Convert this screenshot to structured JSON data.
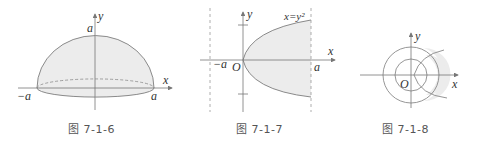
{
  "figures": [
    {
      "id": "7-1-6",
      "caption": "图 7-1-6",
      "description": "Upper half of an ellipsoid / hemisphere of radius a over the x-axis",
      "labels": {
        "y_axis": "y",
        "x_axis": "x",
        "top": "a",
        "left": "−a",
        "right": "a"
      }
    },
    {
      "id": "7-1-7",
      "caption": "图 7-1-7",
      "description": "Region bounded by parabola x=y² and vertical line x=a, shaded",
      "labels": {
        "y_axis": "y",
        "x_axis": "x",
        "origin": "O",
        "left": "−a",
        "right": "a",
        "curve": "x=y²"
      }
    },
    {
      "id": "7-1-8",
      "caption": "图 7-1-8",
      "description": "Two concentric circles at origin with a curve intersecting; shaded region in annulus on right",
      "labels": {
        "y_axis": "y",
        "x_axis": "x",
        "origin": "O"
      }
    }
  ],
  "colors": {
    "line": "#8a8a8a",
    "axis": "#777777",
    "fill": "#ececec",
    "text": "#333333"
  }
}
